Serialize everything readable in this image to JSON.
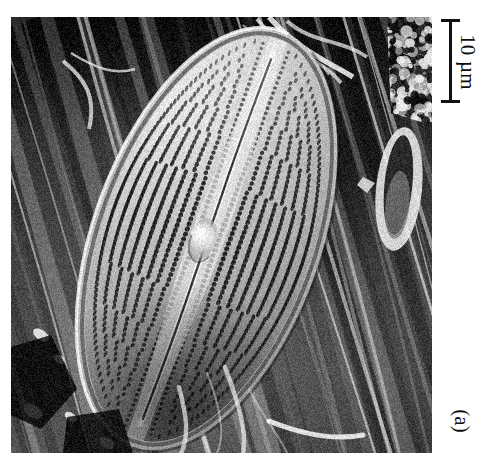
{
  "figure": {
    "domain_description": "Scanning electron micrograph (SEM) of a diatom frustule",
    "panel_label": "(a)",
    "background_color": "#ffffff"
  },
  "scalebar": {
    "label": "10 µm",
    "value": 10,
    "unit": "µm",
    "orientation": "vertical",
    "color": "#111111",
    "length_px": 80,
    "cap_style": "i-beam"
  },
  "micrograph": {
    "alt": "SEM of an elongate diatom valve lying diagonally, showing rows of areolae, a central raphe and central nodule, over a fibrous substrate",
    "left": 11,
    "top": 17,
    "width": 421,
    "height": 436,
    "palette": {
      "background_dark": "#1e1e1e",
      "substrate_mid": "#5a5a5a",
      "valve_face": "#c9c9c9",
      "valve_highlight": "#f2f2f2",
      "pore_dark": "#2b2b2b"
    },
    "subject": {
      "name": "diatom valve",
      "features": [
        "striae (transverse rows of areolae)",
        "raphe (longitudinal slit)",
        "central nodule",
        "rounded apices",
        "raised valve margin"
      ]
    },
    "secondary_objects": [
      "second smaller frustule at right margin",
      "bright filamentous debris at top",
      "reticulate porous aggregate at upper-right",
      "diagonally striated fibrous substrate"
    ]
  }
}
